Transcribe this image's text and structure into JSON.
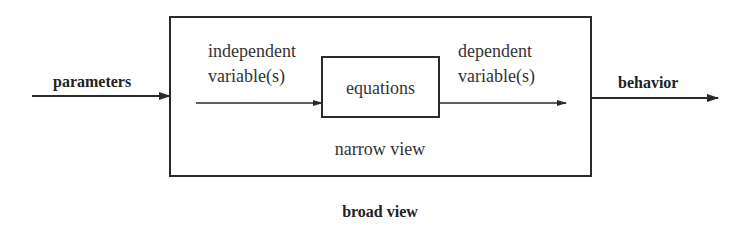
{
  "diagram": {
    "input_label": "parameters",
    "output_label": "behavior",
    "outer_box_label": "broad view",
    "inner_region_label": "narrow view",
    "core_box_label": "equations",
    "inner_input_label": [
      "independent",
      "variable(s)"
    ],
    "inner_output_label": [
      "dependent",
      "variable(s)"
    ],
    "colors": {
      "stroke": "#2a2a2a",
      "background": "#ffffff"
    }
  }
}
